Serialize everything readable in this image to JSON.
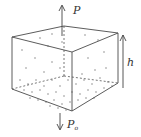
{
  "diagram": {
    "type": "3d-box-gas-column",
    "labels": {
      "top_pressure": "P",
      "bottom_pressure": "P",
      "bottom_pressure_subscript": "o",
      "height": "h"
    },
    "colors": {
      "line": "#4a4a4a",
      "particle": "#b8b8b8",
      "background": "#ffffff"
    }
  }
}
